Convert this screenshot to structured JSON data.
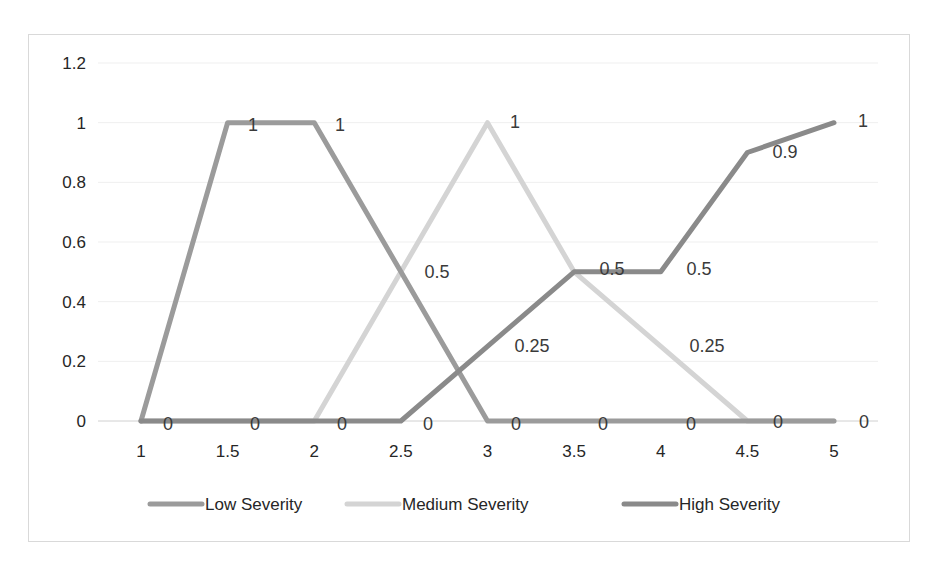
{
  "chart_data": {
    "type": "line",
    "title": "",
    "xlabel": "",
    "ylabel": "",
    "x": [
      "1",
      "1.5",
      "2",
      "2.5",
      "3",
      "3.5",
      "4",
      "4.5",
      "5"
    ],
    "ylim": [
      0,
      1.2
    ],
    "yticks": [
      "0",
      "0.2",
      "0.4",
      "0.6",
      "0.8",
      "1",
      "1.2"
    ],
    "grid": true,
    "legend_position": "bottom",
    "series": [
      {
        "name": "Low Severity",
        "color": "#9b9b9b",
        "values": [
          0,
          1,
          1,
          0.5,
          0,
          0,
          0,
          0,
          0
        ],
        "labels": [
          "0",
          "1",
          "1",
          "0.5",
          "0",
          "0",
          "0",
          "0",
          "0"
        ]
      },
      {
        "name": "Medium Severity",
        "color": "#d4d4d4",
        "values": [
          0,
          0,
          0,
          0.5,
          1,
          0.5,
          0.25,
          0,
          0
        ],
        "labels": [
          "",
          "",
          "",
          "",
          "1",
          "",
          "0.25",
          "",
          ""
        ]
      },
      {
        "name": "High Severity",
        "color": "#8a8a8a",
        "values": [
          0,
          0,
          0,
          0,
          0.25,
          0.5,
          0.5,
          0.9,
          1
        ],
        "labels": [
          "",
          "",
          "",
          "",
          "0.25",
          "0.5",
          "0.5",
          "0.9",
          "1"
        ]
      }
    ]
  },
  "data_labels": [
    {
      "text": "0",
      "x": 168,
      "y": 430
    },
    {
      "text": "1",
      "x": 253,
      "y": 131
    },
    {
      "text": "1",
      "x": 340,
      "y": 131
    },
    {
      "text": "0",
      "x": 255,
      "y": 430
    },
    {
      "text": "0",
      "x": 342,
      "y": 430
    },
    {
      "text": "0.5",
      "x": 437,
      "y": 278
    },
    {
      "text": "0",
      "x": 428,
      "y": 430
    },
    {
      "text": "1",
      "x": 515,
      "y": 128
    },
    {
      "text": "0.25",
      "x": 532,
      "y": 352
    },
    {
      "text": "0",
      "x": 516,
      "y": 430
    },
    {
      "text": "0.5",
      "x": 612,
      "y": 275
    },
    {
      "text": "0",
      "x": 603,
      "y": 430
    },
    {
      "text": "0.5",
      "x": 699,
      "y": 275
    },
    {
      "text": "0.25",
      "x": 707,
      "y": 352
    },
    {
      "text": "0",
      "x": 691,
      "y": 430
    },
    {
      "text": "0.9",
      "x": 785,
      "y": 158
    },
    {
      "text": "0",
      "x": 778,
      "y": 428
    },
    {
      "text": "1",
      "x": 863,
      "y": 127
    },
    {
      "text": "0",
      "x": 864,
      "y": 428
    }
  ]
}
